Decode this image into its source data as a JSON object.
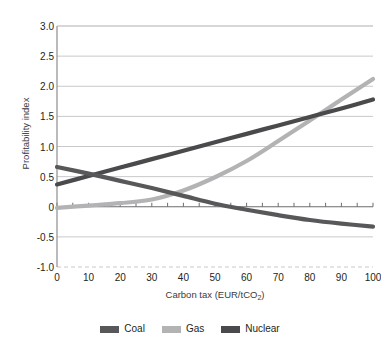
{
  "top_caption_fragment": "",
  "chart_data": {
    "type": "line",
    "title": "",
    "xlabel_text": "Carbon tax (EUR/tCO",
    "xlabel_sub": "2",
    "xlabel_tail": ")",
    "ylabel": "Profitability index",
    "xlim": [
      0,
      100
    ],
    "ylim": [
      -1.0,
      3.0
    ],
    "grid": true,
    "legend_position": "bottom-center",
    "x_ticks": [
      0,
      10,
      20,
      30,
      40,
      50,
      60,
      70,
      80,
      90,
      100
    ],
    "x_tick_labels": [
      "0",
      "10",
      "20",
      "30",
      "40",
      "50",
      "60",
      "70",
      "80",
      "90",
      "100"
    ],
    "x_minor_tick_step": 5,
    "y_ticks": [
      -1.0,
      -0.5,
      0,
      0.5,
      1.0,
      1.5,
      2.0,
      2.5,
      3.0
    ],
    "y_tick_labels": [
      "-1.0",
      "-0.5",
      "0",
      "0.5",
      "1.0",
      "1.5",
      "2.0",
      "2.5",
      "3.0"
    ],
    "x": [
      0,
      10,
      20,
      30,
      40,
      50,
      60,
      70,
      80,
      90,
      100
    ],
    "series": [
      {
        "name": "Coal",
        "color": "#58585b",
        "values": [
          0.66,
          0.55,
          0.43,
          0.31,
          0.18,
          0.05,
          -0.05,
          -0.14,
          -0.22,
          -0.28,
          -0.33
        ]
      },
      {
        "name": "Gas",
        "color": "#b3b3b5",
        "values": [
          -0.02,
          0.02,
          0.06,
          0.12,
          0.27,
          0.49,
          0.76,
          1.09,
          1.43,
          1.78,
          2.12
        ]
      },
      {
        "name": "Nuclear",
        "color": "#4a4a4d",
        "values": [
          0.37,
          0.51,
          0.65,
          0.79,
          0.93,
          1.07,
          1.21,
          1.35,
          1.49,
          1.63,
          1.78
        ]
      }
    ],
    "colors": {
      "coal": "#58585b",
      "gas": "#b3b3b5",
      "nuclear": "#4a4a4d",
      "grid": "#c9c9cb",
      "axis": "#8d8d8f",
      "text": "#231f20"
    }
  },
  "legend": {
    "items": [
      {
        "label": "Coal",
        "color": "#58585b"
      },
      {
        "label": "Gas",
        "color": "#b3b3b5"
      },
      {
        "label": "Nuclear",
        "color": "#4a4a4d"
      }
    ]
  }
}
